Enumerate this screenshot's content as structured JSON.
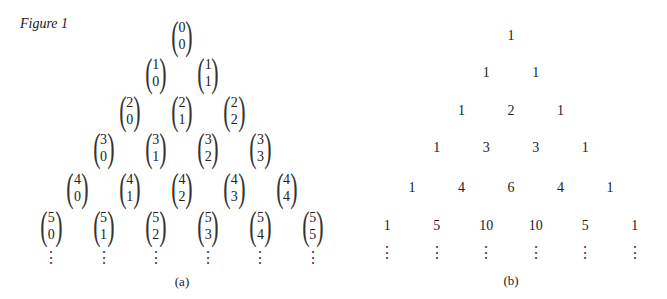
{
  "figure_label": "Figure 1",
  "panel_a": {
    "caption": "(a)",
    "rows": [
      [
        [
          "0",
          "0"
        ]
      ],
      [
        [
          "1",
          "0"
        ],
        [
          "1",
          "1"
        ]
      ],
      [
        [
          "2",
          "0"
        ],
        [
          "2",
          "1"
        ],
        [
          "2",
          "2"
        ]
      ],
      [
        [
          "3",
          "0"
        ],
        [
          "3",
          "1"
        ],
        [
          "3",
          "2"
        ],
        [
          "3",
          "3"
        ]
      ],
      [
        [
          "4",
          "0"
        ],
        [
          "4",
          "1"
        ],
        [
          "4",
          "2"
        ],
        [
          "4",
          "3"
        ],
        [
          "4",
          "4"
        ]
      ],
      [
        [
          "5",
          "0"
        ],
        [
          "5",
          "1"
        ],
        [
          "5",
          "2"
        ],
        [
          "5",
          "3"
        ],
        [
          "5",
          "4"
        ],
        [
          "5",
          "5"
        ]
      ]
    ],
    "continuation": "⋮"
  },
  "panel_b": {
    "caption": "(b)",
    "rows": [
      [
        "1"
      ],
      [
        "1",
        "1"
      ],
      [
        "1",
        "2",
        "1"
      ],
      [
        "1",
        "3",
        "3",
        "1"
      ],
      [
        "1",
        "4",
        "6",
        "4",
        "1"
      ],
      [
        "1",
        "5",
        "10",
        "10",
        "5",
        "1"
      ]
    ],
    "continuation": "⋮"
  }
}
